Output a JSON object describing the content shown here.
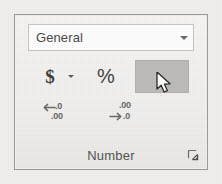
{
  "panel": {
    "group_label": "Number",
    "dialog_launcher_icon": "dialog-box-launcher-icon"
  },
  "format_combo": {
    "value": "General",
    "placeholder": "General",
    "dropdown_icon": "chevron-down-icon"
  },
  "buttons": {
    "accounting": {
      "label": "$",
      "icon": "dollar-sign-icon",
      "dropdown_icon": "chevron-down-icon"
    },
    "percent": {
      "label": "%",
      "icon": "percent-icon"
    },
    "comma": {
      "label": ",",
      "icon": "comma-style-icon",
      "state": "hovered",
      "highlight_color": "#bfbdba"
    },
    "increase_decimal": {
      "icon": "increase-decimal-icon",
      "top_text": ".0",
      "bottom_text": ".00"
    },
    "decrease_decimal": {
      "icon": "decrease-decimal-icon",
      "top_text": ".00",
      "bottom_text": ".0"
    }
  },
  "cursor": {
    "icon": "mouse-pointer-icon"
  },
  "colors": {
    "panel_background": "#f4f3f1",
    "panel_border": "#9b9b99",
    "combo_background": "#ffffff",
    "combo_border": "#c8c6c3",
    "text": "#4a4a48",
    "hover_highlight": "#bfbdba"
  }
}
